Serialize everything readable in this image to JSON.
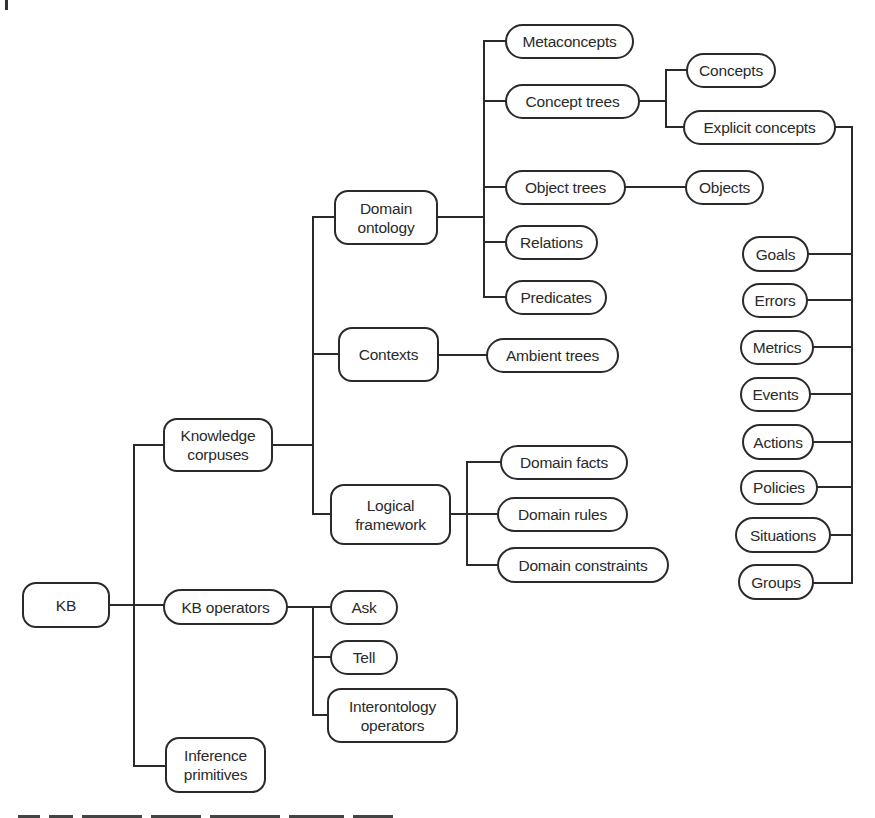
{
  "diagram": {
    "line_color": "#2a2a2a",
    "nodes": [
      {
        "id": "kb",
        "label": "KB",
        "x": 22,
        "y": 582,
        "w": 88,
        "h": 46,
        "shape": "tall"
      },
      {
        "id": "knowledge-corpuses",
        "label": "Knowledge\ncorpuses",
        "x": 163,
        "y": 418,
        "w": 110,
        "h": 54,
        "shape": "tall"
      },
      {
        "id": "kb-operators",
        "label": "KB operators",
        "x": 163,
        "y": 589,
        "w": 125,
        "h": 36,
        "shape": "pill"
      },
      {
        "id": "inference-primitives",
        "label": "Inference\nprimitives",
        "x": 165,
        "y": 737,
        "w": 101,
        "h": 56,
        "shape": "tall"
      },
      {
        "id": "domain-ontology",
        "label": "Domain\nontology",
        "x": 334,
        "y": 190,
        "w": 104,
        "h": 55,
        "shape": "tall"
      },
      {
        "id": "contexts",
        "label": "Contexts",
        "x": 338,
        "y": 327,
        "w": 101,
        "h": 55,
        "shape": "tall"
      },
      {
        "id": "logical-framework",
        "label": "Logical\nframework",
        "x": 330,
        "y": 484,
        "w": 121,
        "h": 61,
        "shape": "tall"
      },
      {
        "id": "ask",
        "label": "Ask",
        "x": 330,
        "y": 590,
        "w": 68,
        "h": 35,
        "shape": "pill"
      },
      {
        "id": "tell",
        "label": "Tell",
        "x": 330,
        "y": 640,
        "w": 68,
        "h": 35,
        "shape": "pill"
      },
      {
        "id": "interontology-operators",
        "label": "Interontology\noperators",
        "x": 327,
        "y": 688,
        "w": 131,
        "h": 55,
        "shape": "tall"
      },
      {
        "id": "metaconcepts",
        "label": "Metaconcepts",
        "x": 505,
        "y": 24,
        "w": 129,
        "h": 35,
        "shape": "pill"
      },
      {
        "id": "concept-trees",
        "label": "Concept trees",
        "x": 505,
        "y": 84,
        "w": 135,
        "h": 35,
        "shape": "pill"
      },
      {
        "id": "object-trees",
        "label": "Object trees",
        "x": 505,
        "y": 170,
        "w": 121,
        "h": 35,
        "shape": "pill"
      },
      {
        "id": "relations",
        "label": "Relations",
        "x": 505,
        "y": 225,
        "w": 93,
        "h": 35,
        "shape": "pill"
      },
      {
        "id": "predicates",
        "label": "Predicates",
        "x": 505,
        "y": 280,
        "w": 102,
        "h": 35,
        "shape": "pill"
      },
      {
        "id": "ambient-trees",
        "label": "Ambient trees",
        "x": 486,
        "y": 338,
        "w": 133,
        "h": 35,
        "shape": "pill"
      },
      {
        "id": "domain-facts",
        "label": "Domain facts",
        "x": 500,
        "y": 445,
        "w": 128,
        "h": 35,
        "shape": "pill"
      },
      {
        "id": "domain-rules",
        "label": "Domain rules",
        "x": 497,
        "y": 497,
        "w": 131,
        "h": 35,
        "shape": "pill"
      },
      {
        "id": "domain-constraints",
        "label": "Domain constraints",
        "x": 497,
        "y": 547,
        "w": 172,
        "h": 36,
        "shape": "pill"
      },
      {
        "id": "concepts",
        "label": "Concepts",
        "x": 686,
        "y": 53,
        "w": 90,
        "h": 35,
        "shape": "pill"
      },
      {
        "id": "explicit-concepts",
        "label": "Explicit concepts",
        "x": 683,
        "y": 110,
        "w": 153,
        "h": 35,
        "shape": "pill"
      },
      {
        "id": "objects",
        "label": "Objects",
        "x": 685,
        "y": 170,
        "w": 79,
        "h": 35,
        "shape": "pill"
      },
      {
        "id": "goals",
        "label": "Goals",
        "x": 742,
        "y": 236,
        "w": 67,
        "h": 36,
        "shape": "pill"
      },
      {
        "id": "errors",
        "label": "Errors",
        "x": 742,
        "y": 283,
        "w": 66,
        "h": 35,
        "shape": "pill"
      },
      {
        "id": "metrics",
        "label": "Metrics",
        "x": 740,
        "y": 330,
        "w": 74,
        "h": 35,
        "shape": "pill"
      },
      {
        "id": "events",
        "label": "Events",
        "x": 740,
        "y": 377,
        "w": 71,
        "h": 35,
        "shape": "pill"
      },
      {
        "id": "actions",
        "label": "Actions",
        "x": 742,
        "y": 424,
        "w": 72,
        "h": 36,
        "shape": "pill"
      },
      {
        "id": "policies",
        "label": "Policies",
        "x": 740,
        "y": 470,
        "w": 78,
        "h": 35,
        "shape": "pill"
      },
      {
        "id": "situations",
        "label": "Situations",
        "x": 735,
        "y": 517,
        "w": 96,
        "h": 36,
        "shape": "pill"
      },
      {
        "id": "groups",
        "label": "Groups",
        "x": 738,
        "y": 564,
        "w": 76,
        "h": 36,
        "shape": "pill"
      }
    ],
    "edges": [
      [
        "kb",
        "knowledge-corpuses"
      ],
      [
        "kb",
        "kb-operators"
      ],
      [
        "kb",
        "inference-primitives"
      ],
      [
        "knowledge-corpuses",
        "domain-ontology"
      ],
      [
        "knowledge-corpuses",
        "contexts"
      ],
      [
        "knowledge-corpuses",
        "logical-framework"
      ],
      [
        "domain-ontology",
        "metaconcepts"
      ],
      [
        "domain-ontology",
        "concept-trees"
      ],
      [
        "domain-ontology",
        "object-trees"
      ],
      [
        "domain-ontology",
        "relations"
      ],
      [
        "domain-ontology",
        "predicates"
      ],
      [
        "concept-trees",
        "concepts"
      ],
      [
        "concept-trees",
        "explicit-concepts"
      ],
      [
        "object-trees",
        "objects"
      ],
      [
        "contexts",
        "ambient-trees"
      ],
      [
        "logical-framework",
        "domain-facts"
      ],
      [
        "logical-framework",
        "domain-rules"
      ],
      [
        "logical-framework",
        "domain-constraints"
      ],
      [
        "kb-operators",
        "ask"
      ],
      [
        "kb-operators",
        "tell"
      ],
      [
        "kb-operators",
        "interontology-operators"
      ],
      [
        "explicit-concepts",
        "goals"
      ],
      [
        "explicit-concepts",
        "errors"
      ],
      [
        "explicit-concepts",
        "metrics"
      ],
      [
        "explicit-concepts",
        "events"
      ],
      [
        "explicit-concepts",
        "actions"
      ],
      [
        "explicit-concepts",
        "policies"
      ],
      [
        "explicit-concepts",
        "situations"
      ],
      [
        "explicit-concepts",
        "groups"
      ]
    ],
    "wires": [
      "M110 605 H163",
      "M134 445 V766 M134 445 H163 M134 766 H165",
      "M273 445 H313 M313 217 V514 M313 217 H334 M313 354 H338 M313 514 H330",
      "M438 217 H484 M484 41 V297 M484 41 H505 M484 101 H505 M484 187 H505 M484 242 H505 M484 297 H505",
      "M640 101 H666 M666 70 V127 M666 70 H686 M666 127 H683",
      "M626 187 H685",
      "M439 355 H486",
      "M451 514 H467 M467 462 V565 M467 462 H500 M467 514 H497 M467 565 H497",
      "M288 607 H313 M313 607 V715 M313 607 H330 M313 657 H330 M313 715 H327",
      "M836 127 H852 M852 127 V583 M809 254 H852 M808 300 H852 M814 347 H852 M811 394 H852 M814 442 H852 M818 487 H852 M831 535 H852 M814 583 H852"
    ]
  }
}
